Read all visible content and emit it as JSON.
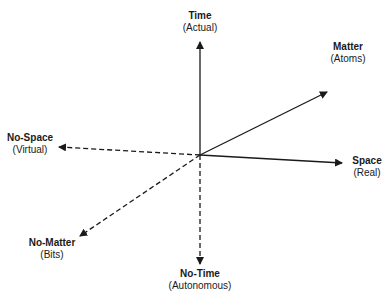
{
  "diagram": {
    "center": [
      200,
      155
    ],
    "colors": {
      "line": "#1a1a1a",
      "background": "#ffffff"
    },
    "axes": [
      {
        "id": "time",
        "title": "Time",
        "subtitle": "(Actual)",
        "style": "solid",
        "tip": [
          200,
          42
        ]
      },
      {
        "id": "matter",
        "title": "Matter",
        "subtitle": "(Atoms)",
        "style": "solid",
        "tip": [
          327,
          92
        ]
      },
      {
        "id": "space",
        "title": "Space",
        "subtitle": "(Real)",
        "style": "solid",
        "tip": [
          342,
          163
        ]
      },
      {
        "id": "no-space",
        "title": "No-Space",
        "subtitle": "(Virtual)",
        "style": "dashed",
        "tip": [
          59,
          147
        ]
      },
      {
        "id": "no-matter",
        "title": "No-Matter",
        "subtitle": "(Bits)",
        "style": "dashed",
        "tip": [
          80,
          236
        ]
      },
      {
        "id": "no-time",
        "title": "No-Time",
        "subtitle": "(Autonomous)",
        "style": "dashed",
        "tip": [
          200,
          264
        ]
      }
    ]
  }
}
